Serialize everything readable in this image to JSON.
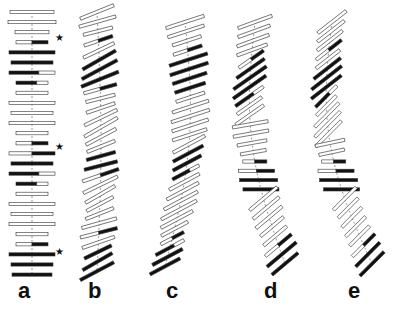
{
  "figure": {
    "colors": {
      "outline": "#333333",
      "dark": "#111111",
      "light": "#ffffff",
      "axis": "#555555"
    },
    "panels": [
      {
        "label": "a",
        "label_x": 18,
        "description": "straight vertical stack of horizontal bars",
        "cx": 32,
        "y0": 12,
        "dy": 10.1,
        "count": 27,
        "angle": 0,
        "curve": 0,
        "widths": [
          44,
          48,
          34,
          32,
          46,
          42,
          46,
          32,
          32,
          46,
          42,
          46,
          32,
          32,
          46,
          42,
          46,
          32,
          32,
          46,
          42,
          46,
          32,
          32,
          46,
          42,
          40
        ],
        "fills": [
          "l",
          "lp",
          "l",
          "ld",
          "dd",
          "d",
          "dl",
          "dl",
          "l",
          "l",
          "l",
          "l",
          "l",
          "ld",
          "ld",
          "d",
          "dl",
          "dl",
          "l",
          "l",
          "l",
          "l",
          "l",
          "ld",
          "dd",
          "d",
          "d"
        ]
      },
      {
        "label": "b",
        "label_x": 88,
        "description": "twisted stack with rhombic plates",
        "cx": 97,
        "y0": 12,
        "dy": 9.6,
        "count": 28,
        "angle": -22,
        "curve": 4,
        "widths": [
          36,
          38,
          30,
          30,
          34,
          38,
          40,
          40,
          34,
          30,
          30,
          36,
          38,
          34,
          30,
          30,
          34,
          38,
          38,
          34,
          30,
          30,
          36,
          38,
          34,
          30,
          34,
          38
        ],
        "fills": [
          "l",
          "l",
          "l",
          "ld",
          "l",
          "d",
          "d",
          "d",
          "ld",
          "l",
          "l",
          "l",
          "l",
          "l",
          "l",
          "d",
          "d",
          "ld",
          "l",
          "l",
          "l",
          "l",
          "l",
          "ld",
          "l",
          "d",
          "d",
          "d"
        ]
      },
      {
        "label": "c",
        "label_x": 166,
        "description": "tilted stack with bend",
        "cx": 175,
        "y0": 22,
        "dy": 9.4,
        "count": 27,
        "angle": -18,
        "curve": 14,
        "widths": [
          40,
          38,
          30,
          30,
          40,
          40,
          36,
          32,
          30,
          38,
          40,
          38,
          36,
          36,
          34,
          32,
          30,
          34,
          36,
          38,
          40,
          36,
          30,
          26,
          32,
          34,
          34
        ],
        "fills": [
          "l",
          "l",
          "l",
          "ld",
          "dd",
          "d",
          "d",
          "d",
          "l",
          "l",
          "l",
          "l",
          "l",
          "l",
          "d",
          "d",
          "dl",
          "l",
          "l",
          "l",
          "l",
          "l",
          "l",
          "ld",
          "dl",
          "d",
          "d"
        ]
      },
      {
        "label": "d",
        "label_x": 264,
        "description": "S-shaped stack with rhombic plates",
        "cx": 270,
        "y0": 22,
        "dy": 9.3,
        "count": 27,
        "angle": -30,
        "curve": -18,
        "widths": [
          36,
          34,
          34,
          32,
          30,
          34,
          40,
          40,
          34,
          30,
          34,
          36,
          36,
          30,
          26,
          24,
          36,
          38,
          36,
          36,
          34,
          34,
          30,
          30,
          34,
          38,
          34
        ],
        "fills": [
          "l",
          "l",
          "l",
          "l",
          "ld",
          "d",
          "d",
          "d",
          "dl",
          "l",
          "l",
          "l",
          "l",
          "l",
          "l",
          "ld",
          "ld",
          "d",
          "d",
          "l",
          "l",
          "l",
          "l",
          "l",
          "ld",
          "d",
          "d"
        ]
      },
      {
        "label": "e",
        "label_x": 348,
        "description": "tilted stack bending right at bottom",
        "cx": 352,
        "y0": 22,
        "dy": 9.3,
        "count": 27,
        "angle": -38,
        "curve": -22,
        "widths": [
          36,
          34,
          32,
          32,
          30,
          34,
          38,
          38,
          30,
          28,
          34,
          36,
          36,
          30,
          26,
          24,
          36,
          38,
          36,
          32,
          28,
          28,
          28,
          28,
          32,
          34,
          34
        ],
        "fills": [
          "l",
          "l",
          "l",
          "ld",
          "l",
          "d",
          "d",
          "d",
          "dl",
          "l",
          "l",
          "l",
          "l",
          "l",
          "l",
          "ld",
          "ld",
          "d",
          "d",
          "l",
          "l",
          "l",
          "l",
          "l",
          "ld",
          "d",
          "d"
        ]
      }
    ],
    "stars": [
      {
        "x": 55,
        "y": 33,
        "glyph": "★"
      },
      {
        "x": 55,
        "y": 142,
        "glyph": "★"
      },
      {
        "x": 55,
        "y": 247,
        "glyph": "★"
      }
    ]
  }
}
